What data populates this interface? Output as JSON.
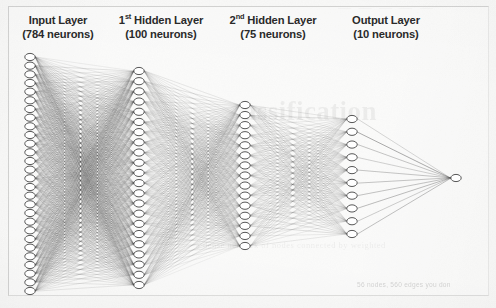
{
  "figure": {
    "kind": "neural-network-architecture-diagram",
    "medium": "scanned-book-page",
    "background_color": "#fafaf9",
    "frame_color": "#78787675",
    "ink_color": "#4a4a4a",
    "node_fill": "#ffffff",
    "node_stroke": "#3f3f3f"
  },
  "labels": [
    {
      "id": "input",
      "name": "Input Layer",
      "name_prefix": "",
      "name_superscript": "",
      "name_rest": "Input Layer",
      "count_text": "(784 neurons)",
      "neurons": 784
    },
    {
      "id": "hidden1",
      "name": "1st Hidden Layer",
      "name_prefix": "1",
      "name_superscript": "st",
      "name_rest": " Hidden Layer",
      "count_text": "(100 neurons)",
      "neurons": 100
    },
    {
      "id": "hidden2",
      "name": "2nd Hidden Layer",
      "name_prefix": "2",
      "name_superscript": "nd",
      "name_rest": " Hidden Layer",
      "count_text": "(75 neurons)",
      "neurons": 75
    },
    {
      "id": "output",
      "name": "Output Layer",
      "name_prefix": "",
      "name_superscript": "",
      "name_rest": "Output Layer",
      "count_text": "(10 neurons)",
      "neurons": 10
    }
  ],
  "diagram": {
    "columns": [
      {
        "id": "input",
        "x": 30,
        "drawn_nodes": 28,
        "top": 57,
        "bottom": 291,
        "node_rx": 5.2,
        "node_ry": 3.6
      },
      {
        "id": "hidden1",
        "x": 139,
        "drawn_nodes": 22,
        "top": 71,
        "bottom": 285,
        "node_rx": 5.2,
        "node_ry": 3.6
      },
      {
        "id": "hidden2",
        "x": 245,
        "drawn_nodes": 15,
        "top": 105,
        "bottom": 246,
        "node_rx": 5.2,
        "node_ry": 3.6
      },
      {
        "id": "output",
        "x": 352,
        "drawn_nodes": 10,
        "top": 119,
        "bottom": 234,
        "node_rx": 5.2,
        "node_ry": 3.6
      },
      {
        "id": "terminal",
        "x": 456,
        "drawn_nodes": 1,
        "top": 178,
        "bottom": 178,
        "node_rx": 5.2,
        "node_ry": 3.6
      }
    ],
    "edge_groups": [
      {
        "from": "input",
        "to": "hidden1",
        "density": "very-dense",
        "opacity": 0.3,
        "width": 0.4
      },
      {
        "from": "hidden1",
        "to": "hidden2",
        "density": "dense",
        "opacity": 0.26,
        "width": 0.4
      },
      {
        "from": "hidden2",
        "to": "output",
        "density": "medium",
        "opacity": 0.3,
        "width": 0.4
      },
      {
        "from": "output",
        "to": "terminal",
        "density": "fan",
        "opacity": 0.62,
        "width": 0.55
      }
    ]
  },
  "bleed_through": {
    "headline": "assification",
    "top_strip": "— — — — —",
    "body_line": "a dense network of nodes connected by weighted",
    "caption": "56 nodes, 560 edges you don"
  }
}
